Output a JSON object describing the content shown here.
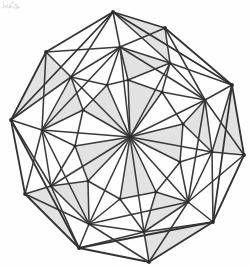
{
  "figure": {
    "width": 251,
    "height": 268,
    "background_color": "#fefefe",
    "edge_color": "#3a3a3a",
    "face_fill_color": "#e2e2e2",
    "vertex_color": "#2b2b2b"
  },
  "chart_data": {
    "type": "diagram",
    "xlabel": "",
    "ylabel": "",
    "graph": {
      "vertex_count": 31,
      "hub_vertex": "C",
      "outer_ring_label": "outer decagon",
      "middle_ring_label": "middle ring",
      "inner_ring_label": "inner ring"
    },
    "vertices": [
      {
        "id": "C",
        "ring": "hub",
        "x": 130,
        "y": 137
      },
      {
        "id": "O0",
        "ring": "outer",
        "x": 113,
        "y": 12
      },
      {
        "id": "O1",
        "ring": "outer",
        "x": 165,
        "y": 28
      },
      {
        "id": "O2",
        "ring": "outer",
        "x": 232,
        "y": 85
      },
      {
        "id": "O3",
        "ring": "outer",
        "x": 244,
        "y": 155
      },
      {
        "id": "O4",
        "ring": "outer",
        "x": 213,
        "y": 222
      },
      {
        "id": "O5",
        "ring": "outer",
        "x": 149,
        "y": 262
      },
      {
        "id": "O6",
        "ring": "outer",
        "x": 79,
        "y": 248
      },
      {
        "id": "O7",
        "ring": "outer",
        "x": 25,
        "y": 194
      },
      {
        "id": "O8",
        "ring": "outer",
        "x": 11,
        "y": 120
      },
      {
        "id": "O9",
        "ring": "outer",
        "x": 46,
        "y": 52
      },
      {
        "id": "M0",
        "ring": "middle",
        "x": 120,
        "y": 47
      },
      {
        "id": "M1",
        "ring": "middle",
        "x": 170,
        "y": 63
      },
      {
        "id": "M2",
        "ring": "middle",
        "x": 205,
        "y": 100
      },
      {
        "id": "M3",
        "ring": "middle",
        "x": 212,
        "y": 152
      },
      {
        "id": "M4",
        "ring": "middle",
        "x": 188,
        "y": 202
      },
      {
        "id": "M5",
        "ring": "middle",
        "x": 144,
        "y": 232
      },
      {
        "id": "M6",
        "ring": "middle",
        "x": 89,
        "y": 224
      },
      {
        "id": "M7",
        "ring": "middle",
        "x": 51,
        "y": 186
      },
      {
        "id": "M8",
        "ring": "middle",
        "x": 42,
        "y": 130
      },
      {
        "id": "M9",
        "ring": "middle",
        "x": 71,
        "y": 77
      },
      {
        "id": "I0",
        "ring": "inner",
        "x": 128,
        "y": 80
      },
      {
        "id": "I1",
        "ring": "inner",
        "x": 162,
        "y": 92
      },
      {
        "id": "I2",
        "ring": "inner",
        "x": 183,
        "y": 124
      },
      {
        "id": "I3",
        "ring": "inner",
        "x": 180,
        "y": 162
      },
      {
        "id": "I4",
        "ring": "inner",
        "x": 156,
        "y": 192
      },
      {
        "id": "I5",
        "ring": "inner",
        "x": 120,
        "y": 199
      },
      {
        "id": "I6",
        "ring": "inner",
        "x": 88,
        "y": 181
      },
      {
        "id": "I7",
        "ring": "inner",
        "x": 75,
        "y": 146
      },
      {
        "id": "I8",
        "ring": "inner",
        "x": 83,
        "y": 110
      },
      {
        "id": "I9",
        "ring": "inner",
        "x": 107,
        "y": 85
      }
    ],
    "edges": [
      [
        "O0",
        "O1"
      ],
      [
        "O1",
        "O2"
      ],
      [
        "O2",
        "O3"
      ],
      [
        "O3",
        "O4"
      ],
      [
        "O4",
        "O5"
      ],
      [
        "O5",
        "O6"
      ],
      [
        "O6",
        "O7"
      ],
      [
        "O7",
        "O8"
      ],
      [
        "O8",
        "O9"
      ],
      [
        "O9",
        "O0"
      ],
      [
        "M0",
        "M1"
      ],
      [
        "M1",
        "M2"
      ],
      [
        "M2",
        "M3"
      ],
      [
        "M3",
        "M4"
      ],
      [
        "M4",
        "M5"
      ],
      [
        "M5",
        "M6"
      ],
      [
        "M6",
        "M7"
      ],
      [
        "M7",
        "M8"
      ],
      [
        "M8",
        "M9"
      ],
      [
        "M9",
        "M0"
      ],
      [
        "I0",
        "I1"
      ],
      [
        "I1",
        "I2"
      ],
      [
        "I2",
        "I3"
      ],
      [
        "I3",
        "I4"
      ],
      [
        "I4",
        "I5"
      ],
      [
        "I5",
        "I6"
      ],
      [
        "I6",
        "I7"
      ],
      [
        "I7",
        "I8"
      ],
      [
        "I8",
        "I9"
      ],
      [
        "I9",
        "I0"
      ],
      [
        "C",
        "I0"
      ],
      [
        "C",
        "I1"
      ],
      [
        "C",
        "I2"
      ],
      [
        "C",
        "I3"
      ],
      [
        "C",
        "I4"
      ],
      [
        "C",
        "I5"
      ],
      [
        "C",
        "I6"
      ],
      [
        "C",
        "I7"
      ],
      [
        "C",
        "I8"
      ],
      [
        "C",
        "I9"
      ],
      [
        "C",
        "M0"
      ],
      [
        "C",
        "M1"
      ],
      [
        "C",
        "M2"
      ],
      [
        "C",
        "M3"
      ],
      [
        "C",
        "M4"
      ],
      [
        "C",
        "M5"
      ],
      [
        "C",
        "M6"
      ],
      [
        "C",
        "M7"
      ],
      [
        "C",
        "M8"
      ],
      [
        "C",
        "M9"
      ],
      [
        "O0",
        "M0"
      ],
      [
        "O1",
        "M1"
      ],
      [
        "O2",
        "M2"
      ],
      [
        "O3",
        "M3"
      ],
      [
        "O4",
        "M4"
      ],
      [
        "O5",
        "M5"
      ],
      [
        "O6",
        "M6"
      ],
      [
        "O7",
        "M7"
      ],
      [
        "O8",
        "M8"
      ],
      [
        "O9",
        "M9"
      ],
      [
        "O0",
        "M1"
      ],
      [
        "O1",
        "M2"
      ],
      [
        "O2",
        "M3"
      ],
      [
        "O3",
        "M4"
      ],
      [
        "O4",
        "M5"
      ],
      [
        "O5",
        "M6"
      ],
      [
        "O6",
        "M7"
      ],
      [
        "O7",
        "M8"
      ],
      [
        "O8",
        "M9"
      ],
      [
        "O9",
        "M0"
      ],
      [
        "O0",
        "M9"
      ],
      [
        "O1",
        "M0"
      ],
      [
        "O2",
        "M1"
      ],
      [
        "O3",
        "M2"
      ],
      [
        "O4",
        "M3"
      ],
      [
        "O5",
        "M4"
      ],
      [
        "O6",
        "M5"
      ],
      [
        "O7",
        "M6"
      ],
      [
        "O8",
        "M7"
      ],
      [
        "O9",
        "M8"
      ],
      [
        "M0",
        "I0"
      ],
      [
        "M1",
        "I1"
      ],
      [
        "M2",
        "I2"
      ],
      [
        "M3",
        "I3"
      ],
      [
        "M4",
        "I4"
      ],
      [
        "M5",
        "I5"
      ],
      [
        "M6",
        "I6"
      ],
      [
        "M7",
        "I7"
      ],
      [
        "M8",
        "I8"
      ],
      [
        "M9",
        "I9"
      ],
      [
        "M0",
        "I9"
      ],
      [
        "M1",
        "I0"
      ],
      [
        "M2",
        "I1"
      ],
      [
        "M3",
        "I2"
      ],
      [
        "M4",
        "I3"
      ],
      [
        "M5",
        "I4"
      ],
      [
        "M6",
        "I5"
      ],
      [
        "M7",
        "I6"
      ],
      [
        "M8",
        "I7"
      ],
      [
        "M9",
        "I8"
      ],
      [
        "O0",
        "O2"
      ],
      [
        "O2",
        "O4"
      ],
      [
        "O4",
        "O6"
      ],
      [
        "O6",
        "O8"
      ],
      [
        "O8",
        "O0"
      ],
      [
        "M0",
        "M2"
      ],
      [
        "M2",
        "M4"
      ],
      [
        "M4",
        "M6"
      ],
      [
        "M6",
        "M8"
      ],
      [
        "M8",
        "M0"
      ]
    ],
    "shaded_faces": [
      [
        "C",
        "I0",
        "I1"
      ],
      [
        "C",
        "I2",
        "I3"
      ],
      [
        "C",
        "I4",
        "I5"
      ],
      [
        "C",
        "I6",
        "I7"
      ],
      [
        "C",
        "I8",
        "I9"
      ],
      [
        "M0",
        "M1",
        "I0"
      ],
      [
        "M2",
        "M3",
        "I2"
      ],
      [
        "M4",
        "M5",
        "I4"
      ],
      [
        "M6",
        "M7",
        "I6"
      ],
      [
        "M8",
        "M9",
        "I8"
      ],
      [
        "O0",
        "O1",
        "M1"
      ],
      [
        "O2",
        "O3",
        "M3"
      ],
      [
        "O4",
        "O5",
        "M5"
      ],
      [
        "O6",
        "O7",
        "M7"
      ],
      [
        "O8",
        "O9",
        "M9"
      ]
    ]
  }
}
